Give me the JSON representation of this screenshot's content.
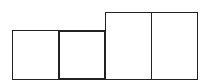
{
  "diagram": {
    "colors": {
      "stroke": "#222222",
      "background": "#ffffff"
    },
    "boxes": [
      {
        "id": "box-1",
        "x": 12,
        "y": 30,
        "w": 47,
        "h": 50,
        "stroke": 1.2,
        "highlighted": false
      },
      {
        "id": "box-2",
        "x": 58,
        "y": 30,
        "w": 48,
        "h": 50,
        "stroke": 2.4,
        "highlighted": true
      },
      {
        "id": "box-3",
        "x": 105,
        "y": 12,
        "w": 47,
        "h": 68,
        "stroke": 1.2,
        "highlighted": false
      },
      {
        "id": "box-4",
        "x": 151,
        "y": 12,
        "w": 47,
        "h": 68,
        "stroke": 1.2,
        "highlighted": false
      }
    ]
  }
}
